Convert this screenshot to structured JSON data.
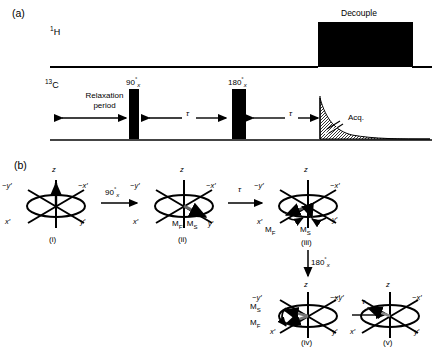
{
  "figure": {
    "panel_a_tag": "(a)",
    "panel_b_tag": "(b)"
  },
  "panel_a": {
    "channels": [
      {
        "name": "proton",
        "label_html": "1H",
        "label_iso": "1",
        "label_elem": "H"
      },
      {
        "name": "carbon",
        "label_html": "13C",
        "label_iso": "13",
        "label_elem": "C"
      }
    ],
    "decouple_label": "Decouple",
    "relaxation_label_line1": "Relaxation",
    "relaxation_label_line2": "period",
    "pulse_90": {
      "angle": "90",
      "degree": "°",
      "phase": "x"
    },
    "pulse_180": {
      "angle": "180",
      "degree": "°",
      "phase": "x"
    },
    "tau_1": "τ",
    "tau_2": "τ",
    "acq_label": "Acq.",
    "colors": {
      "ink": "#000000",
      "block_fill": "#000000"
    }
  },
  "panel_b": {
    "axes": {
      "z": "z",
      "x_prime": "x′",
      "y_prime": "y′",
      "neg_x_prime": "−x′",
      "neg_y_prime": "−y′"
    },
    "vectors": {
      "mf": "M",
      "mf_sub": "F",
      "ms": "M",
      "ms_sub": "S"
    },
    "diagrams": [
      {
        "id": "i",
        "caption": "(i)",
        "labels": [],
        "magnetization": "along +z"
      },
      {
        "id": "ii",
        "caption": "(ii)",
        "labels": [
          "M_F, M_S"
        ],
        "magnetization": "along y′, coincident"
      },
      {
        "id": "iii",
        "caption": "(iii)",
        "labels": [
          "M_F",
          "M_S"
        ],
        "magnetization": "fanned out about y′"
      },
      {
        "id": "iv",
        "caption": "(iv)",
        "labels": [
          "M_S",
          "M_F"
        ],
        "magnetization": "reflected to −y′ side"
      },
      {
        "id": "v",
        "caption": "(v)",
        "labels": [],
        "magnetization": "refocused along −y′"
      }
    ],
    "transitions": [
      {
        "from": "i",
        "to": "ii",
        "label_angle": "90",
        "label_deg": "°",
        "label_phase": "x",
        "dir": "right"
      },
      {
        "from": "ii",
        "to": "iii",
        "label_tau": "τ",
        "dir": "right"
      },
      {
        "from": "iii",
        "to": "iv",
        "label_angle": "180",
        "label_deg": "°",
        "label_phase": "x",
        "dir": "down"
      },
      {
        "from": "iv",
        "to": "v",
        "label_tau": "τ",
        "dir": "right"
      }
    ],
    "combined_label_ii": "M",
    "combined_label_ii_sub1": "F",
    "combined_label_ii_mid": ", M",
    "combined_label_ii_sub2": "S"
  }
}
